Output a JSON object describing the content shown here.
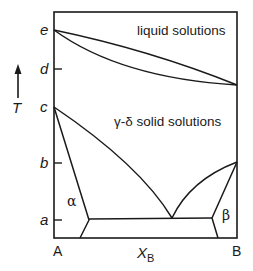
{
  "diagram": {
    "type": "binary phase diagram",
    "y_axis": {
      "label": "T",
      "ticks": [
        {
          "label": "e",
          "y": 30
        },
        {
          "label": "d",
          "y": 69
        },
        {
          "label": "c",
          "y": 107
        },
        {
          "label": "b",
          "y": 163
        },
        {
          "label": "a",
          "y": 220
        }
      ]
    },
    "x_axis": {
      "label_main": "X",
      "label_sub": "B",
      "left_label": "A",
      "right_label": "B"
    },
    "regions": {
      "liquid": "liquid solutions",
      "solid": "γ-δ solid solutions",
      "alpha": "α",
      "beta": "β"
    },
    "colors": {
      "line": "#1a1a1a",
      "background": "#ffffff"
    }
  }
}
